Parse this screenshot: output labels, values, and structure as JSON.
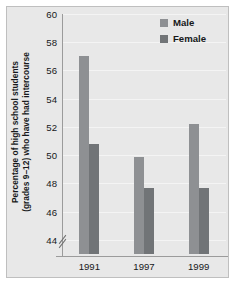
{
  "chart_data": {
    "type": "bar",
    "title": "",
    "subtitle": "",
    "xlabel": "",
    "ylabel": "Percentage of high school students (grades 9–12) who have had intercourse",
    "ylabel_lines": [
      "Percentage of high school students",
      "(grades 9–12) who have had intercourse"
    ],
    "categories": [
      "1991",
      "1997",
      "1999"
    ],
    "series": [
      {
        "name": "Male",
        "values": [
          57.0,
          49.9,
          52.2
        ],
        "color": "#8e9093"
      },
      {
        "name": "Female",
        "values": [
          50.8,
          47.7,
          47.7
        ],
        "color": "#717477"
      }
    ],
    "ylim": [
      43,
      60
    ],
    "yticks": [
      60,
      58,
      56,
      54,
      52,
      50,
      48,
      46,
      44
    ],
    "ytick_labels": [
      "60",
      "58",
      "56",
      "54",
      "52",
      "50",
      "48",
      "46",
      "44"
    ],
    "grid": true,
    "y_axis_break": true,
    "legend_position": "top-right",
    "legend": [
      "Male",
      "Female"
    ],
    "annotations": []
  },
  "legend": {
    "entries": [
      {
        "label": "Male",
        "swatch": "male-swatch"
      },
      {
        "label": "Female",
        "swatch": "female-swatch"
      }
    ]
  },
  "colors": {
    "panel_background": "#e8e8e8",
    "page_background": "#ffffff",
    "gridline": "#f4f4f4",
    "axis": "#9b9b9b",
    "male": "#8e9093",
    "female": "#717477",
    "text": "#16181a"
  }
}
